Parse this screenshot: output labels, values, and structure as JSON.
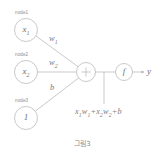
{
  "figure": {
    "caption": "그림3",
    "stroke_color": "#b0b0b0",
    "text_color": "#7a7a7a"
  },
  "nodes": [
    {
      "tag": "node1",
      "value": "x",
      "sub": "1",
      "cx": 26,
      "cy": 30,
      "r": 11.5
    },
    {
      "tag": "node2",
      "value": "x",
      "sub": "2",
      "cx": 26,
      "cy": 72,
      "r": 11.5
    },
    {
      "tag": "node3",
      "value": "1",
      "sub": "",
      "cx": 26,
      "cy": 118,
      "r": 11.5
    }
  ],
  "sum_node": {
    "symbol": "+",
    "cx": 86,
    "cy": 72,
    "r": 9.5
  },
  "activation_node": {
    "symbol": "f",
    "cx": 124,
    "cy": 72,
    "r": 8.5
  },
  "output": {
    "label": "y",
    "x": 148,
    "y": 72
  },
  "edges": [
    {
      "from": "node1",
      "to": "sum",
      "label": "w",
      "sub": "1",
      "lx": 49,
      "ly": 38
    },
    {
      "from": "node2",
      "to": "sum",
      "label": "w",
      "sub": "2",
      "lx": 49,
      "ly": 58
    },
    {
      "from": "node3",
      "to": "sum",
      "label": "b",
      "sub": "",
      "lx": 50,
      "ly": 85
    }
  ],
  "formula": {
    "terms": [
      "x",
      "1",
      "w",
      "1",
      "x",
      "2",
      "w",
      "2",
      "b"
    ],
    "text": "x1w1 + x2w2 + b",
    "x": 75,
    "y": 111
  }
}
